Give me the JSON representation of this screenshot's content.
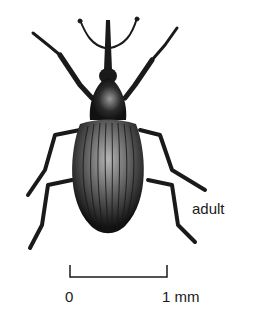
{
  "figure": {
    "stage_label": "adult",
    "colors": {
      "ink": "#1a1a1a",
      "highlight": "#bdbdbd",
      "background": "#ffffff"
    }
  },
  "scale_bar": {
    "start_label": "0",
    "end_label": "1 mm"
  }
}
